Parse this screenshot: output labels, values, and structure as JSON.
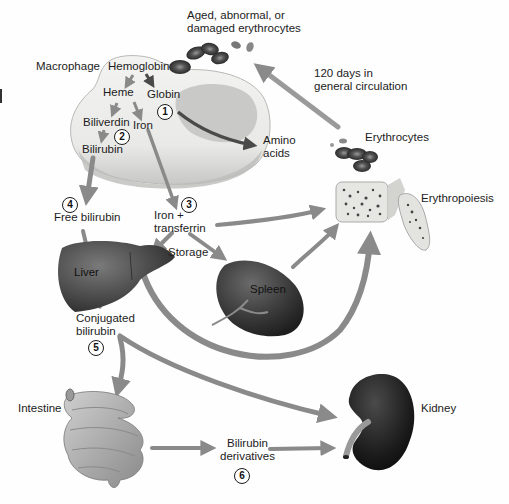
{
  "diagram": {
    "labels": {
      "aged": "Aged, abnormal, or damaged erythrocytes",
      "aged_line1": "Aged, abnormal, or",
      "aged_line2": "damaged erythrocytes",
      "macrophage": "Macrophage",
      "hemoglobin": "Hemoglobin",
      "heme": "Heme",
      "globin": "Globin",
      "biliverdin": "Biliverdin",
      "iron": "Iron",
      "bilirubin": "Bilirubin",
      "amino_line1": "Amino",
      "amino_line2": "acids",
      "circulation_line1": "120 days in",
      "circulation_line2": "general circulation",
      "erythrocytes": "Erythrocytes",
      "erythropoiesis": "Erythropoiesis",
      "free_bilirubin": "Free bilirubin",
      "iron_transferrin_line1": "Iron +",
      "iron_transferrin_line2": "transferrin",
      "storage": "Storage",
      "liver": "Liver",
      "spleen": "Spleen",
      "conjugated_line1": "Conjugated",
      "conjugated_line2": "bilirubin",
      "intestine": "Intestine",
      "kidney": "Kidney",
      "derivatives_line1": "Bilirubin",
      "derivatives_line2": "derivatives"
    },
    "steps": [
      "1",
      "2",
      "3",
      "4",
      "5",
      "6"
    ],
    "colors": {
      "arrow": "#8a8a8a",
      "arrow_dark": "#4a4a4a",
      "macrophage_fill": "#f1f1ef",
      "macrophage_shadow": "#bdbdbb",
      "organ_dark": "#2e2e2e",
      "organ_mid": "#5a5a5a",
      "rbc": "#3a3a3a"
    }
  }
}
